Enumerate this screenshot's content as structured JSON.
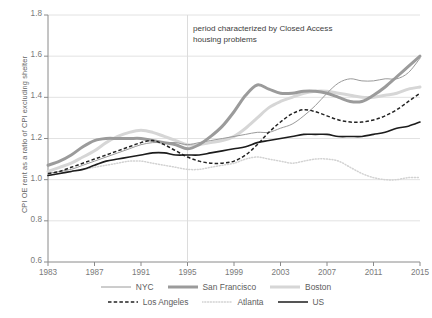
{
  "chart_data": {
    "type": "line",
    "title": "",
    "xlabel": "",
    "ylabel": "CPI OE rent as a ratio of CPI excluding shelter",
    "xlim": [
      1983,
      2015
    ],
    "ylim": [
      0.6,
      1.8
    ],
    "grid": true,
    "legend_position": "bottom",
    "annotations": [
      {
        "text": "period characterized by Closed Access\nhousing problems",
        "x": 1995,
        "y": 1.72
      }
    ],
    "vertical_reference_line": {
      "x": 1995
    },
    "ytick_labels": [
      "0.6",
      "0.8",
      "1.0",
      "1.2",
      "1.4",
      "1.6",
      "1.8"
    ],
    "ytick_values": [
      0.6,
      0.8,
      1.0,
      1.2,
      1.4,
      1.6,
      1.8
    ],
    "xtick_labels": [
      "1983",
      "1987",
      "1991",
      "1995",
      "1999",
      "2003",
      "2007",
      "2011",
      "2015"
    ],
    "xtick_values": [
      1983,
      1987,
      1991,
      1995,
      1999,
      2003,
      2007,
      2011,
      2015
    ],
    "x": [
      1983,
      1984,
      1985,
      1986,
      1987,
      1988,
      1989,
      1990,
      1991,
      1992,
      1993,
      1994,
      1995,
      1996,
      1997,
      1998,
      1999,
      2000,
      2001,
      2002,
      2003,
      2004,
      2005,
      2006,
      2007,
      2008,
      2009,
      2010,
      2011,
      2012,
      2013,
      2014,
      2015
    ],
    "series": [
      {
        "name": "NYC",
        "color": "#9a9a9a",
        "style": "solid-thin",
        "values": [
          1.03,
          1.04,
          1.05,
          1.07,
          1.09,
          1.11,
          1.13,
          1.15,
          1.17,
          1.18,
          1.18,
          1.18,
          1.17,
          1.18,
          1.19,
          1.2,
          1.21,
          1.22,
          1.23,
          1.23,
          1.25,
          1.27,
          1.31,
          1.36,
          1.42,
          1.47,
          1.49,
          1.48,
          1.48,
          1.49,
          1.49,
          1.52,
          1.59
        ]
      },
      {
        "name": "San Francisco",
        "color": "#9b9b9b",
        "style": "solid-thick",
        "values": [
          1.07,
          1.09,
          1.12,
          1.16,
          1.19,
          1.2,
          1.2,
          1.2,
          1.2,
          1.19,
          1.18,
          1.17,
          1.15,
          1.17,
          1.21,
          1.26,
          1.33,
          1.41,
          1.46,
          1.44,
          1.42,
          1.42,
          1.43,
          1.43,
          1.42,
          1.4,
          1.38,
          1.38,
          1.41,
          1.45,
          1.5,
          1.55,
          1.6
        ]
      },
      {
        "name": "Boston",
        "color": "#d6d6d6",
        "style": "solid-thick",
        "values": [
          1.04,
          1.06,
          1.08,
          1.11,
          1.14,
          1.18,
          1.21,
          1.23,
          1.24,
          1.23,
          1.21,
          1.19,
          1.17,
          1.17,
          1.18,
          1.19,
          1.21,
          1.25,
          1.3,
          1.35,
          1.38,
          1.4,
          1.42,
          1.43,
          1.43,
          1.42,
          1.41,
          1.4,
          1.4,
          1.41,
          1.42,
          1.44,
          1.45
        ]
      },
      {
        "name": "Los Angeles",
        "color": "#222222",
        "style": "dashed",
        "values": [
          1.03,
          1.04,
          1.06,
          1.08,
          1.1,
          1.12,
          1.14,
          1.16,
          1.18,
          1.19,
          1.17,
          1.14,
          1.11,
          1.09,
          1.08,
          1.08,
          1.09,
          1.12,
          1.17,
          1.23,
          1.28,
          1.32,
          1.34,
          1.33,
          1.31,
          1.29,
          1.28,
          1.28,
          1.29,
          1.31,
          1.34,
          1.38,
          1.42
        ]
      },
      {
        "name": "Atlanta",
        "color": "#d2d2d2",
        "style": "dotted",
        "values": [
          1.02,
          1.03,
          1.04,
          1.05,
          1.06,
          1.07,
          1.08,
          1.09,
          1.09,
          1.08,
          1.07,
          1.06,
          1.05,
          1.05,
          1.06,
          1.07,
          1.08,
          1.1,
          1.11,
          1.1,
          1.09,
          1.08,
          1.09,
          1.1,
          1.1,
          1.09,
          1.06,
          1.03,
          1.01,
          1.0,
          1.0,
          1.01,
          1.01
        ]
      },
      {
        "name": "US",
        "color": "#1c1c1c",
        "style": "solid-medium",
        "values": [
          1.02,
          1.03,
          1.04,
          1.05,
          1.07,
          1.09,
          1.1,
          1.11,
          1.12,
          1.13,
          1.13,
          1.12,
          1.12,
          1.12,
          1.13,
          1.14,
          1.15,
          1.16,
          1.18,
          1.19,
          1.2,
          1.21,
          1.22,
          1.22,
          1.22,
          1.21,
          1.21,
          1.21,
          1.22,
          1.23,
          1.25,
          1.26,
          1.28
        ]
      }
    ]
  },
  "legend": {
    "rows": [
      [
        {
          "label": "NYC",
          "key": "nyc"
        },
        {
          "label": "San Francisco",
          "key": "san-francisco"
        },
        {
          "label": "Boston",
          "key": "boston"
        }
      ],
      [
        {
          "label": "Los Angeles",
          "key": "los-angeles"
        },
        {
          "label": "Atlanta",
          "key": "atlanta"
        },
        {
          "label": "US",
          "key": "us"
        }
      ]
    ]
  }
}
